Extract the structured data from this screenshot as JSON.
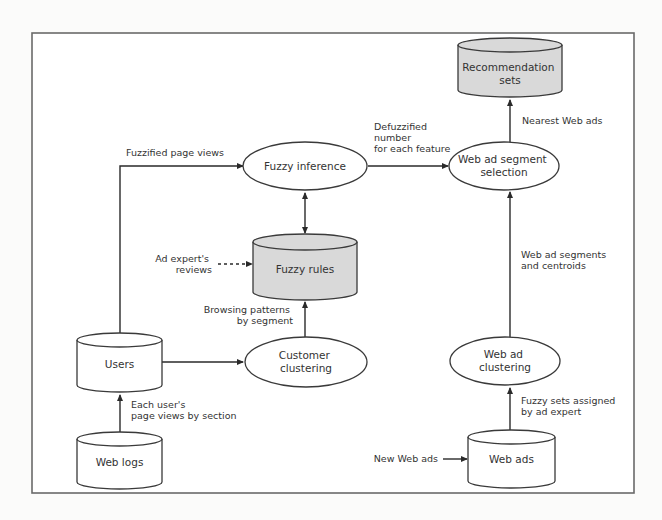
{
  "diagram": {
    "colors": {
      "background": "#fbfbfa",
      "frame_fill": "#ffffff",
      "frame_stroke": "#6a6a6a",
      "shaded_fill": "#d9d9d9",
      "plain_fill": "#ffffff",
      "stroke": "#3a3a3a"
    },
    "nodes": {
      "recommendation_sets": {
        "type": "database",
        "shaded": true,
        "lines": [
          "Recommendation",
          "sets"
        ]
      },
      "fuzzy_inference": {
        "type": "process",
        "lines": [
          "Fuzzy inference"
        ]
      },
      "web_ad_segment_selection": {
        "type": "process",
        "lines": [
          "Web ad segment",
          "selection"
        ]
      },
      "fuzzy_rules": {
        "type": "database",
        "shaded": true,
        "lines": [
          "Fuzzy rules"
        ]
      },
      "users": {
        "type": "database",
        "shaded": false,
        "lines": [
          "Users"
        ]
      },
      "customer_clustering": {
        "type": "process",
        "lines": [
          "Customer",
          "clustering"
        ]
      },
      "web_ad_clustering": {
        "type": "process",
        "lines": [
          "Web ad",
          "clustering"
        ]
      },
      "web_logs": {
        "type": "database",
        "shaded": false,
        "lines": [
          "Web logs"
        ]
      },
      "web_ads": {
        "type": "database",
        "shaded": false,
        "lines": [
          "Web ads"
        ]
      }
    },
    "edges": {
      "users_to_inference": {
        "from": "users",
        "to": "fuzzy_inference",
        "label": [
          "Fuzzified page views"
        ]
      },
      "inference_to_selection": {
        "from": "fuzzy_inference",
        "to": "web_ad_segment_selection",
        "label": [
          "Defuzzified",
          "number",
          "for each feature"
        ]
      },
      "selection_to_recommendation": {
        "from": "web_ad_segment_selection",
        "to": "recommendation_sets",
        "label": [
          "Nearest Web ads"
        ]
      },
      "inference_rules_bidirectional": {
        "from": "fuzzy_inference",
        "to": "fuzzy_rules",
        "label": []
      },
      "expert_to_rules": {
        "from": "external",
        "to": "fuzzy_rules",
        "style": "dashed",
        "label": [
          "Ad expert's",
          "reviews"
        ]
      },
      "clustering_to_rules": {
        "from": "customer_clustering",
        "to": "fuzzy_rules",
        "label": [
          "Browsing patterns",
          "by segment"
        ]
      },
      "users_to_clustering": {
        "from": "users",
        "to": "customer_clustering",
        "label": []
      },
      "weblogs_to_users": {
        "from": "web_logs",
        "to": "users",
        "label": [
          "Each user's",
          "page views by section"
        ]
      },
      "adclustering_to_selection": {
        "from": "web_ad_clustering",
        "to": "web_ad_segment_selection",
        "label": [
          "Web ad segments",
          "and centroids"
        ]
      },
      "webads_to_adclustering": {
        "from": "web_ads",
        "to": "web_ad_clustering",
        "label": [
          "Fuzzy sets assigned",
          "by ad expert"
        ]
      },
      "new_to_webads": {
        "from": "external",
        "to": "web_ads",
        "label": [
          "New Web ads"
        ]
      }
    }
  }
}
